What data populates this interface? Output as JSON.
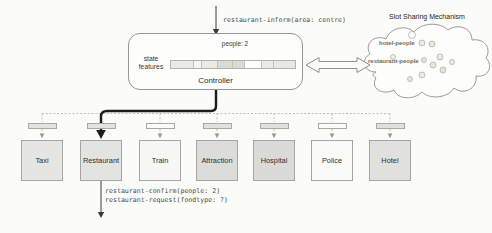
{
  "top_act": {
    "text": "restaurant-inform(area: centre)"
  },
  "controller": {
    "label": "Controller",
    "state_features": [
      "state",
      "features"
    ],
    "annotation": "people: 2",
    "feature_segments": [
      {
        "width": 23,
        "color": "#eaeae6"
      },
      {
        "width": 8,
        "color": "#f4f4f0"
      },
      {
        "width": 16,
        "color": "#eaeae6"
      },
      {
        "width": 15,
        "color": "#d8dcd2"
      },
      {
        "width": 12,
        "color": "#d8dcd2"
      },
      {
        "width": 17,
        "color": "#fdfdfc"
      },
      {
        "width": 12,
        "color": "#eaeae6"
      },
      {
        "width": 21,
        "color": "#e7e7e3"
      }
    ]
  },
  "slot_sharing": {
    "title": "Slot Sharing Mechanism",
    "slots": [
      {
        "label": "hotel-people"
      },
      {
        "label": "restaurant-people"
      }
    ],
    "circles": [
      {
        "x": 52,
        "y": 13,
        "r": 3.5,
        "fill": "#fdfdfb"
      },
      {
        "x": 62,
        "y": 21,
        "r": 3,
        "fill": "#ebebe5"
      },
      {
        "x": 72,
        "y": 22,
        "r": 3,
        "fill": "#e7e7e0"
      },
      {
        "x": 33,
        "y": 35,
        "r": 2.5,
        "fill": "#efefe9"
      },
      {
        "x": 80,
        "y": 35,
        "r": 3,
        "fill": "#eaeae3"
      },
      {
        "x": 64,
        "y": 38,
        "r": 2.5,
        "fill": "#e5e5de"
      },
      {
        "x": 92,
        "y": 40,
        "r": 2.5,
        "fill": "#ecece6"
      },
      {
        "x": 73,
        "y": 43,
        "r": 3,
        "fill": "#e8e8e1"
      },
      {
        "x": 83,
        "y": 48,
        "r": 3,
        "fill": "#e2e2da"
      },
      {
        "x": 62,
        "y": 53,
        "r": 3,
        "fill": "#eaeae3"
      },
      {
        "x": 50,
        "y": 57,
        "r": 2.5,
        "fill": "#e7e7e0"
      }
    ]
  },
  "domains": [
    {
      "label": "Taxi",
      "box_fill": "#e5e5e1",
      "bar_fill": "#e3e3df",
      "active": false
    },
    {
      "label": "Restaurant",
      "box_fill": "#e3e3df",
      "bar_fill": "#e3e3df",
      "active": true
    },
    {
      "label": "Train",
      "box_fill": "#f7f7f4",
      "bar_fill": "#fbfbf8",
      "active": false
    },
    {
      "label": "Attraction",
      "box_fill": "#dcdcd8",
      "bar_fill": "#e1e1dd",
      "active": false
    },
    {
      "label": "Hospital",
      "box_fill": "#dadad6",
      "bar_fill": "#e0e0dc",
      "active": false
    },
    {
      "label": "Police",
      "box_fill": "#fafaf7",
      "bar_fill": "#fbfbf8",
      "active": false
    },
    {
      "label": "Hotel",
      "box_fill": "#e0e0dc",
      "bar_fill": "#e0e0dc",
      "active": false
    }
  ],
  "output_acts": {
    "lines": [
      "restaurant-confirm(people: 2)",
      "restaurant-request(foodtype: ?)"
    ]
  },
  "colors": {
    "main_arrow": "#1d1d1b",
    "dashed_line": "#b9b9b1",
    "outline": "#97978f"
  }
}
